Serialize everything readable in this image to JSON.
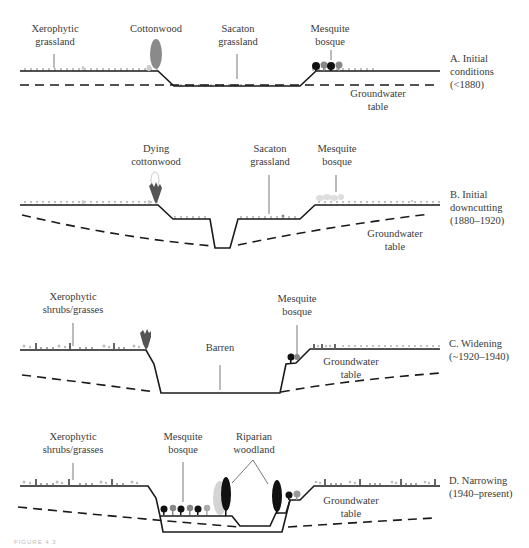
{
  "figure": {
    "caption_fragment": "FIGURE 4.3",
    "colors": {
      "ground_line": "#1a1a1a",
      "groundwater_dash": "#1a1a1a",
      "leader_line": "#555555",
      "cottonwood": "#8a8a8a",
      "dying_cottonwood": "#555555",
      "mesquite_dark": "#111111",
      "mesquite_mid": "#777777",
      "mesquite_light": "#aaaaaa",
      "riparian_dark": "#111111",
      "riparian_light": "#c8c8c8",
      "text": "#3a3a3a"
    },
    "panels": [
      {
        "id": "A",
        "title_line1": "A. Initial",
        "title_line2": "conditions",
        "title_line3": "(<1880)",
        "labels": {
          "xerophytic_1": "Xerophytic",
          "xerophytic_2": "grassland",
          "cottonwood": "Cottonwood",
          "sacaton_1": "Sacaton",
          "sacaton_2": "grassland",
          "mesquite_1": "Mesquite",
          "mesquite_2": "bosque",
          "groundwater_1": "Groundwater",
          "groundwater_2": "table"
        }
      },
      {
        "id": "B",
        "title_line1": "B. Initial",
        "title_line2": "downcutting",
        "title_line3": "(1880–1920)",
        "labels": {
          "dying_1": "Dying",
          "dying_2": "cottonwood",
          "sacaton_1": "Sacaton",
          "sacaton_2": "grassland",
          "mesquite_1": "Mesquite",
          "mesquite_2": "bosque",
          "groundwater_1": "Groundwater",
          "groundwater_2": "table"
        }
      },
      {
        "id": "C",
        "title_line1": "C. Widening",
        "title_line2": "(~1920–1940)",
        "labels": {
          "xerophytic_1": "Xerophytic",
          "xerophytic_2": "shrubs/grasses",
          "barren": "Barren",
          "mesquite_1": "Mesquite",
          "mesquite_2": "bosque",
          "groundwater_1": "Groundwater",
          "groundwater_2": "table"
        }
      },
      {
        "id": "D",
        "title_line1": "D. Narrowing",
        "title_line2": "(1940–present)",
        "labels": {
          "xerophytic_1": "Xerophytic",
          "xerophytic_2": "shrubs/grasses",
          "mesquite_1": "Mesquite",
          "mesquite_2": "bosque",
          "riparian_1": "Riparian",
          "riparian_2": "woodland",
          "groundwater_1": "Groundwater",
          "groundwater_2": "table"
        }
      }
    ]
  }
}
